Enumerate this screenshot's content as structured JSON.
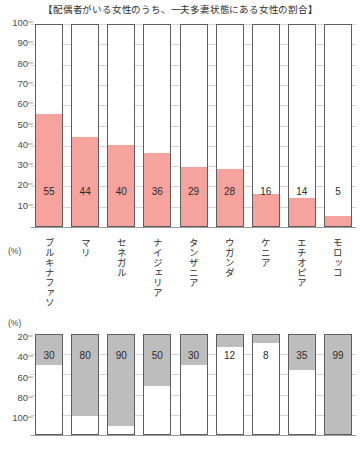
{
  "figure": {
    "title": "【配偶者がいる女性のうち、一夫多妻状態にある女性の割合】",
    "bottom_caption": ""
  },
  "chart_data": [
    {
      "type": "bar",
      "id": "polygamy-share",
      "title": "【配偶者がいる女性のうち、一夫多妻状態にある女性の割合】",
      "xlabel": "",
      "ylabel": "(%)",
      "unit_label": "(%)",
      "ylim": [
        0,
        100
      ],
      "y_inverted": false,
      "grid": true,
      "legend": "none",
      "yticks": [
        100,
        90,
        80,
        70,
        60,
        50,
        40,
        30,
        20,
        10
      ],
      "categories": [
        "ブルキナファソ",
        "マリ",
        "セネガル",
        "ナイジェリア",
        "タンザニア",
        "ウガンダ",
        "ケニア",
        "エチオピア",
        "モロッコ"
      ],
      "values": [
        55,
        44,
        40,
        36,
        29,
        28,
        16,
        14,
        5
      ],
      "bar_color": "#f5a39c",
      "bar_outline": "#5e5e5e"
    },
    {
      "type": "bar",
      "id": "secondary-series",
      "title": "",
      "xlabel": "",
      "ylabel": "(%)",
      "unit_label": "(%)",
      "ylim": [
        0,
        100
      ],
      "y_inverted": true,
      "grid": true,
      "legend": "none",
      "yticks": [
        20,
        40,
        60,
        80,
        100
      ],
      "categories": [
        "ブルキナファソ",
        "マリ",
        "セネガル",
        "ナイジェリア",
        "タンザニア",
        "ウガンダ",
        "ケニア",
        "エチオピア",
        "モロッコ"
      ],
      "values": [
        30,
        80,
        90,
        50,
        30,
        12,
        8,
        35,
        99
      ],
      "bar_color": "#bdbdbd",
      "bar_outline": "#5e5e5e"
    }
  ]
}
